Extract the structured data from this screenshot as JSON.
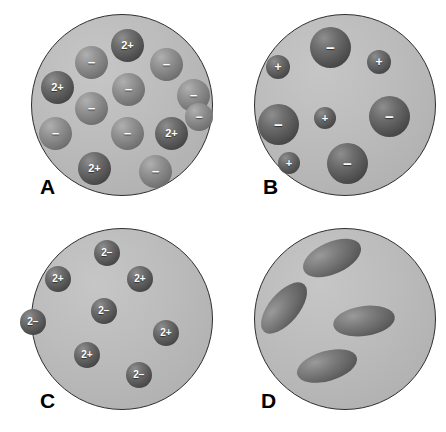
{
  "figure": {
    "width": 446,
    "height": 432,
    "background_color": "#ffffff",
    "disc_fill_color": "#b8b8b8",
    "disc_border_color": "#2e2e2e",
    "particle_dark_color": "#4a4a4a",
    "particle_mid_color": "#7b7b7b",
    "label_color": "#000000"
  },
  "panels": [
    {
      "id": "A",
      "label": "A",
      "label_x": 40,
      "label_y": 176,
      "disc": {
        "x": 31,
        "y": 14,
        "size": 182
      },
      "particles": [
        {
          "sign": "2+",
          "tone": "dark",
          "x": 111,
          "y": 29,
          "size": 33,
          "font": 11
        },
        {
          "sign": "−",
          "tone": "mid",
          "x": 75,
          "y": 46,
          "size": 33,
          "font": 13
        },
        {
          "sign": "−",
          "tone": "mid",
          "x": 150,
          "y": 48,
          "size": 33,
          "font": 13
        },
        {
          "sign": "2+",
          "tone": "dark",
          "x": 41,
          "y": 71,
          "size": 33,
          "font": 11
        },
        {
          "sign": "−",
          "tone": "mid",
          "x": 112,
          "y": 73,
          "size": 33,
          "font": 13
        },
        {
          "sign": "−",
          "tone": "mid",
          "x": 75,
          "y": 92,
          "size": 33,
          "font": 13
        },
        {
          "sign": "−",
          "tone": "mid",
          "x": 177,
          "y": 79,
          "size": 33,
          "font": 13
        },
        {
          "sign": "−",
          "tone": "mid",
          "x": 39,
          "y": 117,
          "size": 33,
          "font": 13
        },
        {
          "sign": "−",
          "tone": "mid",
          "x": 111,
          "y": 117,
          "size": 33,
          "font": 13
        },
        {
          "sign": "2+",
          "tone": "dark",
          "x": 155,
          "y": 117,
          "size": 33,
          "font": 11
        },
        {
          "sign": "2+",
          "tone": "dark",
          "x": 78,
          "y": 152,
          "size": 33,
          "font": 11
        },
        {
          "sign": "−",
          "tone": "mid",
          "x": 139,
          "y": 155,
          "size": 33,
          "font": 13
        },
        {
          "sign": "−",
          "tone": "mid",
          "x": 185,
          "y": 103,
          "size": 28,
          "font": 12
        }
      ],
      "capsules": []
    },
    {
      "id": "B",
      "label": "B",
      "label_x": 40,
      "label_y": 176,
      "disc": {
        "x": 31,
        "y": 14,
        "size": 182
      },
      "particles": [
        {
          "sign": "−",
          "tone": "dark",
          "x": 87,
          "y": 27,
          "size": 41,
          "font": 15
        },
        {
          "sign": "+",
          "tone": "dark",
          "x": 144,
          "y": 50,
          "size": 24,
          "font": 12
        },
        {
          "sign": "+",
          "tone": "dark",
          "x": 43,
          "y": 55,
          "size": 24,
          "font": 12
        },
        {
          "sign": "−",
          "tone": "dark",
          "x": 35,
          "y": 104,
          "size": 41,
          "font": 15
        },
        {
          "sign": "+",
          "tone": "dark",
          "x": 91,
          "y": 107,
          "size": 22,
          "font": 11
        },
        {
          "sign": "−",
          "tone": "dark",
          "x": 146,
          "y": 96,
          "size": 41,
          "font": 15
        },
        {
          "sign": "+",
          "tone": "dark",
          "x": 55,
          "y": 152,
          "size": 22,
          "font": 11
        },
        {
          "sign": "−",
          "tone": "dark",
          "x": 104,
          "y": 143,
          "size": 41,
          "font": 15
        }
      ],
      "capsules": []
    },
    {
      "id": "C",
      "label": "C",
      "label_x": 40,
      "label_y": 174,
      "disc": {
        "x": 31,
        "y": 12,
        "size": 182
      },
      "particles": [
        {
          "sign": "2−",
          "tone": "dark",
          "x": 94,
          "y": 24,
          "size": 26,
          "font": 10
        },
        {
          "sign": "2+",
          "tone": "dark",
          "x": 45,
          "y": 50,
          "size": 26,
          "font": 10
        },
        {
          "sign": "2+",
          "tone": "dark",
          "x": 127,
          "y": 50,
          "size": 26,
          "font": 10
        },
        {
          "sign": "2−",
          "tone": "dark",
          "x": 91,
          "y": 82,
          "size": 26,
          "font": 10
        },
        {
          "sign": "2−",
          "tone": "dark",
          "x": 20,
          "y": 93,
          "size": 26,
          "font": 10
        },
        {
          "sign": "2+",
          "tone": "dark",
          "x": 153,
          "y": 104,
          "size": 26,
          "font": 10
        },
        {
          "sign": "2+",
          "tone": "dark",
          "x": 74,
          "y": 126,
          "size": 26,
          "font": 10
        },
        {
          "sign": "2−",
          "tone": "dark",
          "x": 126,
          "y": 146,
          "size": 26,
          "font": 10
        }
      ],
      "capsules": []
    },
    {
      "id": "D",
      "label": "D",
      "label_x": 38,
      "label_y": 174,
      "disc": {
        "x": 31,
        "y": 12,
        "size": 182
      },
      "particles": [],
      "capsules": [
        {
          "x": 78,
          "y": 26,
          "w": 62,
          "h": 32,
          "rot": -24
        },
        {
          "x": 30,
          "y": 77,
          "w": 62,
          "h": 30,
          "rot": -50
        },
        {
          "x": 110,
          "y": 90,
          "w": 62,
          "h": 30,
          "rot": -8
        },
        {
          "x": 73,
          "y": 135,
          "w": 62,
          "h": 30,
          "rot": -16
        }
      ]
    }
  ]
}
